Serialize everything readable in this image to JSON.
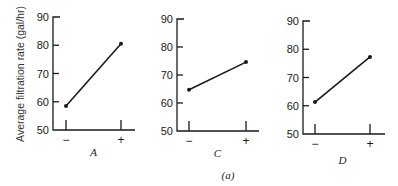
{
  "chart_data": [
    {
      "type": "line",
      "title": "",
      "factor": "A",
      "xlabel": "A",
      "ylabel": "Average filtration rate (gal/hr)",
      "categories": [
        "−",
        "+"
      ],
      "values": [
        58.5,
        80.5
      ],
      "ylim": [
        50,
        90
      ],
      "yticks": [
        50,
        60,
        70,
        80,
        90
      ],
      "grid": false
    },
    {
      "type": "line",
      "title": "",
      "factor": "C",
      "xlabel": "C",
      "ylabel": "",
      "categories": [
        "−",
        "+"
      ],
      "values": [
        64.7,
        74.6
      ],
      "ylim": [
        50,
        90
      ],
      "yticks": [
        50,
        60,
        70,
        80,
        90
      ],
      "grid": false
    },
    {
      "type": "line",
      "title": "",
      "factor": "D",
      "xlabel": "D",
      "ylabel": "",
      "categories": [
        "−",
        "+"
      ],
      "values": [
        61.3,
        77.3
      ],
      "ylim": [
        50,
        90
      ],
      "yticks": [
        50,
        60,
        70,
        80,
        90
      ],
      "grid": false
    }
  ],
  "labels": {
    "ylabel": "Average filtration rate (gal/hr)",
    "caption": "(a)",
    "minus": "−",
    "plus": "+",
    "ticks": [
      "90",
      "80",
      "70",
      "60",
      "50"
    ]
  },
  "panels": [
    {
      "factor": "A"
    },
    {
      "factor": "C"
    },
    {
      "factor": "D"
    }
  ]
}
